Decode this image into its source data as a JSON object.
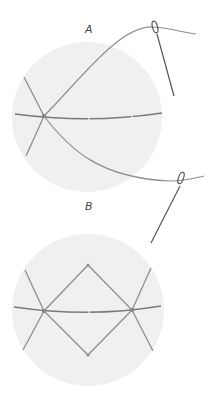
{
  "diagram": {
    "type": "stitch-illustration",
    "colors": {
      "background": "#ffffff",
      "fabric_hoop": "#f0f0f0",
      "thread": "#8e8e8e",
      "thread_dark": "#7a7a7a",
      "needle": "#555555",
      "label": "#444444"
    },
    "panels": [
      {
        "id": "A",
        "label": "A",
        "description": "Hoop with one star point stitched; needle bringing thread up, second needle below"
      },
      {
        "id": "B",
        "label": "B",
        "description": "Hoop with diamond shape joining two crossed star points along the horizontal guide"
      }
    ]
  }
}
